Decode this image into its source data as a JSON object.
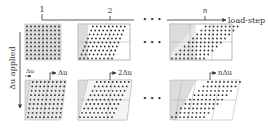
{
  "top_axis": {
    "ticks": [
      {
        "label": "1",
        "x": 43
      },
      {
        "label": "2",
        "x": 110
      },
      {
        "label": "n",
        "x": 205
      }
    ],
    "ellipsis": "• • •",
    "arrow_label": "load-step"
  },
  "left_axis": {
    "label": "Δu applied"
  },
  "row1": {
    "ellipsis": "• • •"
  },
  "row2": {
    "offset_label": "Δu",
    "panels": [
      {
        "arrow_label": "Δu"
      },
      {
        "arrow_label": "2Δu"
      },
      {
        "arrow_label": "nΔu"
      }
    ],
    "ellipsis": "• • •"
  },
  "colors": {
    "line": "#333333",
    "grid": "#aaaaaa",
    "shade": "#dcdcdc",
    "dot": "#333333"
  }
}
